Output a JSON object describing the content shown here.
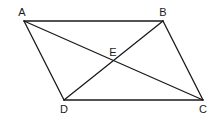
{
  "diagram": {
    "type": "parallelogram with diagonals",
    "points": {
      "A": {
        "label": "A",
        "x": 24,
        "y": 21,
        "lx": 22,
        "ly": 16
      },
      "B": {
        "label": "B",
        "x": 163,
        "y": 21,
        "lx": 163,
        "ly": 16
      },
      "C": {
        "label": "C",
        "x": 203,
        "y": 100,
        "lx": 203,
        "ly": 113
      },
      "D": {
        "label": "D",
        "x": 64,
        "y": 100,
        "lx": 64,
        "ly": 113
      },
      "E": {
        "label": "E",
        "x": 114,
        "y": 61,
        "lx": 113,
        "ly": 56
      }
    },
    "segments": [
      [
        "A",
        "B"
      ],
      [
        "B",
        "C"
      ],
      [
        "C",
        "D"
      ],
      [
        "D",
        "A"
      ],
      [
        "A",
        "C"
      ],
      [
        "B",
        "D"
      ]
    ],
    "colors": {
      "stroke": "#1a1a1a",
      "background": "#ffffff"
    }
  }
}
